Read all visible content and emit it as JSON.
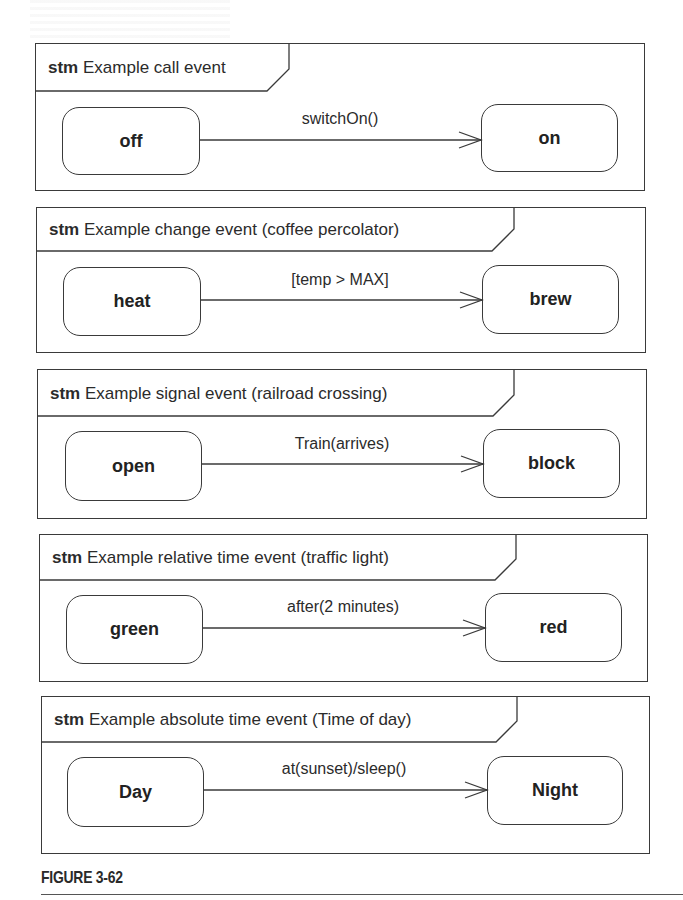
{
  "figure": {
    "caption": "FIGURE 3-62"
  },
  "diagrams": [
    {
      "keyword": "stm",
      "title": "Example call event",
      "source_state": "off",
      "target_state": "on",
      "transition": "switchOn()"
    },
    {
      "keyword": "stm",
      "title": "Example change event (coffee percolator)",
      "source_state": "heat",
      "target_state": "brew",
      "transition": "[temp > MAX]"
    },
    {
      "keyword": "stm",
      "title": "Example signal event (railroad crossing)",
      "source_state": "open",
      "target_state": "block",
      "transition": "Train(arrives)"
    },
    {
      "keyword": "stm",
      "title": "Example relative time event (traffic light)",
      "source_state": "green",
      "target_state": "red",
      "transition": "after(2 minutes)"
    },
    {
      "keyword": "stm",
      "title": "Example absolute time event (Time of day)",
      "source_state": "Day",
      "target_state": "Night",
      "transition": "at(sunset)/sleep()"
    }
  ],
  "colors": {
    "line": "#3a3a3a",
    "text": "#2a2a2a",
    "background": "#ffffff"
  }
}
